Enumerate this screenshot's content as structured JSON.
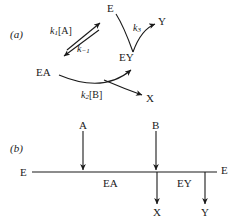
{
  "figure": {
    "panel_a": {
      "tag": "(a)",
      "species": {
        "e_top": "E",
        "ea": "EA",
        "ey": "EY",
        "y": "Y",
        "x": "X"
      },
      "rate_constants": {
        "k1_forward_k": "k",
        "k1_forward_sub": "1",
        "k1_forward_reactant": "[A]",
        "k_minus1_k": "k",
        "k_minus1_sub": "−1",
        "k2_k": "k",
        "k2_sub": "2",
        "k2_reactant": "[B]",
        "k3_k": "k",
        "k3_sub": "3"
      }
    },
    "panel_b": {
      "tag": "(b)",
      "backbone": {
        "start_enzyme": "E",
        "complex_1": "EA",
        "complex_2": "EY",
        "end_enzyme": "E"
      },
      "substrates_in": [
        "A",
        "B"
      ],
      "products_out": [
        "X",
        "Y"
      ]
    },
    "colors": {
      "ink": "#1a1a1a",
      "line": "#222222",
      "background": "#ffffff"
    }
  }
}
